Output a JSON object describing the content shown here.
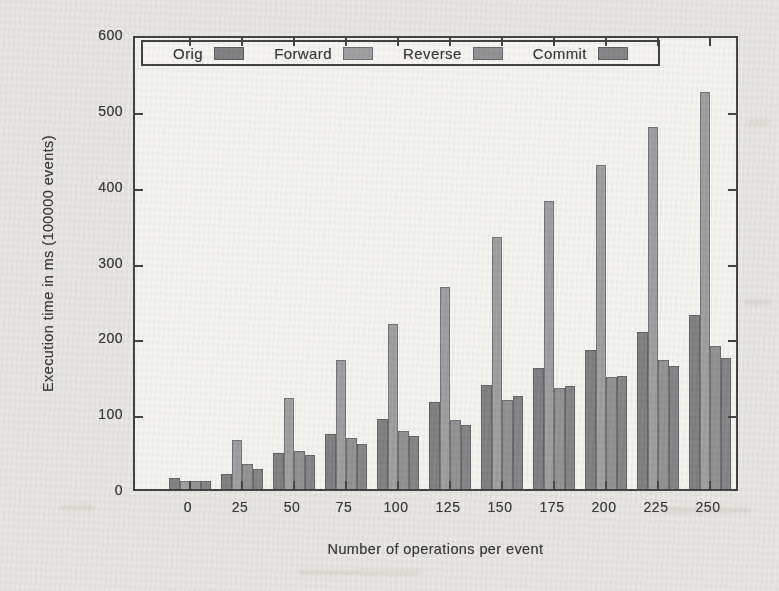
{
  "colors": {
    "page_bg": "#e7e5e1",
    "plot_bg": "#f4f3ef",
    "line": "#3c3c3c",
    "text": "#343434"
  },
  "chart_data": {
    "type": "bar",
    "title": "",
    "xlabel": "Number of operations per event",
    "ylabel": "Execution time in ms (100000 events)",
    "categories": [
      "0",
      "25",
      "50",
      "75",
      "100",
      "125",
      "150",
      "175",
      "200",
      "225",
      "250"
    ],
    "ylim": [
      0,
      600
    ],
    "yticks": [
      0,
      100,
      200,
      300,
      400,
      500,
      600
    ],
    "grid": false,
    "legend_position": "top-inside",
    "series": [
      {
        "name": "Orig",
        "color": "#7c7c7e",
        "values": [
          15,
          20,
          47,
          73,
          92,
          115,
          137,
          160,
          183,
          207,
          230
        ]
      },
      {
        "name": "Forward",
        "color": "#9c9c9e",
        "values": [
          10,
          65,
          120,
          170,
          218,
          267,
          332,
          380,
          427,
          477,
          523
        ]
      },
      {
        "name": "Reverse",
        "color": "#8f8f91",
        "values": [
          10,
          33,
          50,
          67,
          77,
          91,
          118,
          133,
          148,
          170,
          188
        ]
      },
      {
        "name": "Commit",
        "color": "#818183",
        "values": [
          10,
          27,
          45,
          60,
          70,
          84,
          123,
          136,
          149,
          162,
          173
        ]
      }
    ]
  }
}
